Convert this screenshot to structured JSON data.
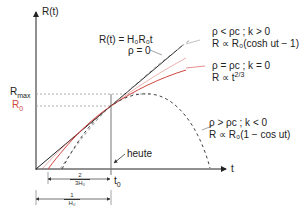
{
  "axes": {
    "y_label": "R(t)",
    "x_label": "t"
  },
  "y_ticks": {
    "rmax_main": "R",
    "rmax_sub": "max",
    "r0_main": "R",
    "r0_sub": "0"
  },
  "x_ticks": {
    "t0_main": "t",
    "t0_sub": "0"
  },
  "annotations": {
    "linear_formula": "R(t) = H₀R₀t",
    "linear_rho": "ρ = 0",
    "open_cond": "ρ < ρc ; k > 0",
    "open_law": "R ∝ R₀(cosh ut − 1)",
    "flat_cond": "ρ = ρc ; k = 0",
    "flat_law_main": "R ∝ t",
    "flat_law_exp": "2/3",
    "closed_cond": "ρ > ρc ; k < 0",
    "closed_law": "R ∝ R₀(1 − cos ut)",
    "today": "heute"
  },
  "dimensions": {
    "two_thirds_num": "2",
    "two_thirds_den": "3H₀",
    "one_num": "1",
    "one_den": "H₀"
  },
  "colors": {
    "axis": "#222222",
    "linear": "#222222",
    "flat": "#d0453f",
    "dashed": "#555555",
    "guide": "#999999"
  }
}
